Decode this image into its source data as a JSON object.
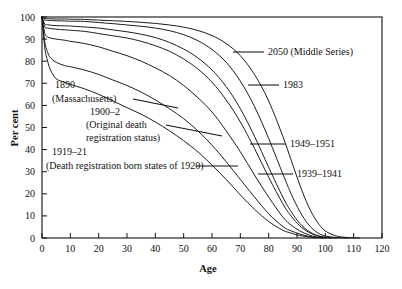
{
  "chart_data": {
    "type": "line",
    "title": "",
    "xlabel": "Age",
    "ylabel": "Per cent",
    "xlim": [
      0,
      120
    ],
    "ylim": [
      0,
      100
    ],
    "grid": false,
    "legend_position": "inline-annotations",
    "x_ticks": [
      0,
      10,
      20,
      30,
      40,
      50,
      60,
      70,
      80,
      90,
      100,
      110,
      120
    ],
    "y_ticks": [
      0,
      10,
      20,
      30,
      40,
      50,
      60,
      70,
      80,
      90,
      100
    ],
    "x_tick_labels": [
      "0",
      "10",
      "20",
      "30",
      "40",
      "50",
      "60",
      "70",
      "80",
      "90",
      "100",
      "110",
      "120"
    ],
    "y_tick_labels": [
      "0",
      "10",
      "20",
      "30",
      "40",
      "50",
      "60",
      "70",
      "80",
      "90",
      "100"
    ],
    "series": [
      {
        "name": "1890 (Massachusetts)",
        "label": "1890",
        "sublabel": "(Massachusetts)",
        "x": [
          0,
          1,
          2,
          3,
          5,
          8,
          10,
          15,
          20,
          25,
          30,
          35,
          40,
          45,
          50,
          55,
          60,
          65,
          70,
          75,
          80,
          85,
          88,
          90,
          92,
          95,
          97
        ],
        "y": [
          100,
          86,
          80,
          76,
          72,
          70.5,
          69.5,
          67.5,
          65,
          62,
          59,
          56,
          52.5,
          48.5,
          44,
          39,
          33,
          26.5,
          19.5,
          13,
          7.5,
          3.5,
          2.2,
          1.4,
          0.9,
          0.3,
          0
        ]
      },
      {
        "name": "1900-2 (Original death registration status)",
        "label": "1900–2",
        "sublabel": "(Original death registration status)",
        "x": [
          0,
          1,
          2,
          3,
          5,
          8,
          10,
          15,
          20,
          25,
          30,
          35,
          40,
          45,
          50,
          55,
          60,
          65,
          70,
          75,
          80,
          85,
          88,
          91,
          94,
          97,
          99
        ],
        "y": [
          100,
          88.5,
          84,
          81.5,
          79.5,
          78,
          77.5,
          76,
          74,
          71.5,
          69,
          66,
          62.5,
          58.5,
          54,
          48.5,
          42,
          34.5,
          26.5,
          18.5,
          11,
          5.2,
          3.2,
          1.8,
          0.8,
          0.2,
          0
        ]
      },
      {
        "name": "1919-21 (Death registration born states of 1920)",
        "label": "1919–21",
        "sublabel": "(Death registration born states of 1920)",
        "x": [
          0,
          1,
          2,
          3,
          5,
          8,
          10,
          15,
          20,
          25,
          30,
          35,
          40,
          45,
          50,
          55,
          60,
          65,
          70,
          75,
          80,
          85,
          88,
          91,
          94,
          97,
          100
        ],
        "y": [
          100,
          92.5,
          91,
          90.5,
          90,
          89.5,
          89,
          88,
          86.5,
          84.5,
          82.5,
          80,
          77,
          73.5,
          69,
          63.5,
          57,
          48.5,
          39,
          28.5,
          18.5,
          9.5,
          5.8,
          3.2,
          1.5,
          0.4,
          0
        ]
      },
      {
        "name": "1939-1941",
        "label": "1939–1941",
        "x": [
          0,
          1,
          2,
          3,
          5,
          8,
          10,
          15,
          20,
          25,
          30,
          35,
          40,
          45,
          50,
          55,
          60,
          65,
          70,
          75,
          80,
          85,
          88,
          91,
          94,
          97,
          100,
          102
        ],
        "y": [
          100,
          95.5,
          95,
          94.8,
          94.5,
          94.2,
          94,
          93.5,
          92.5,
          91.5,
          90.5,
          89,
          87,
          84.5,
          81,
          76.5,
          70.5,
          62.5,
          52.5,
          40.5,
          27.5,
          15.5,
          9.8,
          5.5,
          2.7,
          1.0,
          0.2,
          0
        ]
      },
      {
        "name": "1949-1951",
        "label": "1949–1951",
        "x": [
          0,
          1,
          2,
          3,
          5,
          8,
          10,
          15,
          20,
          25,
          30,
          35,
          40,
          45,
          50,
          55,
          60,
          65,
          70,
          75,
          80,
          85,
          88,
          91,
          94,
          97,
          100,
          104
        ],
        "y": [
          100,
          96.8,
          96.5,
          96.3,
          96.1,
          96,
          95.9,
          95.5,
          95,
          94.2,
          93.3,
          92.2,
          90.7,
          88.5,
          85.5,
          81.5,
          76,
          68.5,
          58.5,
          46,
          32,
          18.5,
          11.8,
          6.6,
          3.2,
          1.2,
          0.3,
          0
        ]
      },
      {
        "name": "1983",
        "label": "1983",
        "x": [
          0,
          1,
          2,
          3,
          5,
          8,
          10,
          15,
          20,
          25,
          30,
          35,
          40,
          45,
          50,
          55,
          60,
          65,
          70,
          75,
          80,
          85,
          88,
          91,
          94,
          97,
          100,
          104,
          108
        ],
        "y": [
          100,
          98.6,
          98.5,
          98.4,
          98.3,
          98.2,
          98.1,
          98,
          97.5,
          97,
          96.4,
          95.8,
          95,
          93.8,
          92,
          89.3,
          85.3,
          79.5,
          71,
          59.5,
          45,
          29,
          19.8,
          12,
          6.2,
          2.6,
          0.9,
          0.2,
          0
        ]
      },
      {
        "name": "2050 (Middle Series)",
        "label": "2050 (Middle Series)",
        "x": [
          0,
          1,
          2,
          3,
          5,
          8,
          10,
          15,
          20,
          25,
          30,
          35,
          40,
          45,
          50,
          55,
          60,
          65,
          70,
          75,
          80,
          85,
          88,
          91,
          94,
          97,
          100,
          104,
          108,
          112
        ],
        "y": [
          100,
          99.3,
          99.2,
          99.2,
          99.1,
          99.1,
          99,
          98.9,
          98.6,
          98.3,
          98,
          97.6,
          97.1,
          96.4,
          95.4,
          93.9,
          91.6,
          88,
          82.5,
          74,
          62,
          46,
          35,
          24,
          14.5,
          7.5,
          3.2,
          0.9,
          0.2,
          0
        ]
      }
    ],
    "annotations": [
      {
        "id": "a1890",
        "text": "1890",
        "x_px": 55,
        "y_px": 88
      },
      {
        "id": "a1890sub",
        "text": "(Massachusetts)",
        "x_px": 52,
        "y_px": 102
      },
      {
        "id": "a1900",
        "text": "1900–2",
        "x_px": 90,
        "y_px": 115
      },
      {
        "id": "a1900sub1",
        "text": "(Original death",
        "x_px": 86,
        "y_px": 128
      },
      {
        "id": "a1900sub2",
        "text": "registration status)",
        "x_px": 86,
        "y_px": 141
      },
      {
        "id": "a1919",
        "text": "1919–21",
        "x_px": 52,
        "y_px": 155
      },
      {
        "id": "a1919sub",
        "text": "(Death registration born states of 1920)",
        "x_px": 46,
        "y_px": 169
      },
      {
        "id": "a2050",
        "text": "2050 (Middle Series)",
        "x_px": 268,
        "y_px": 55
      },
      {
        "id": "a1983",
        "text": "1983",
        "x_px": 283,
        "y_px": 88
      },
      {
        "id": "a1949",
        "text": "1949–1951",
        "x_px": 290,
        "y_px": 147
      },
      {
        "id": "a1939",
        "text": "1939–1941",
        "x_px": 297,
        "y_px": 177
      }
    ]
  },
  "colors": {
    "background": "#ffffff",
    "axis": "#111111",
    "curve": "#111111",
    "text": "#111111"
  }
}
